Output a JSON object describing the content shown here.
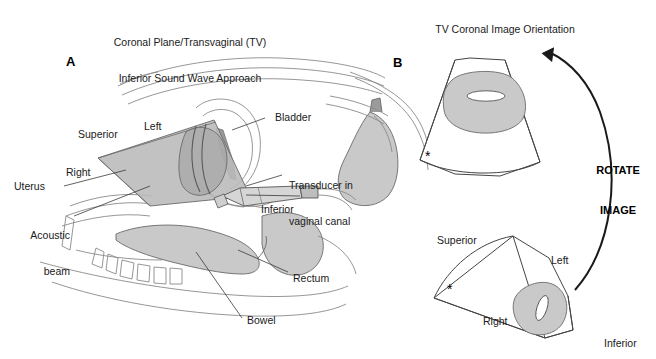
{
  "figure": {
    "panel_a": {
      "letter": "A",
      "title_line1": "Coronal Plane/Transvaginal (TV)",
      "title_line2": "Inferior Sound Wave Approach",
      "labels": {
        "superior": "Superior",
        "left": "Left",
        "right": "Right",
        "inferior": "Inferior",
        "uterus": "Uterus",
        "acoustic_beam_line1": "Acoustic",
        "acoustic_beam_line2": "beam",
        "bladder": "Bladder",
        "transducer_line1": "Transducer in",
        "transducer_line2": "vaginal canal",
        "rectum": "Rectum",
        "bowel": "Bowel"
      },
      "marker": "*"
    },
    "panel_b": {
      "letter": "B",
      "title": "TV Coronal Image Orientation",
      "rotate_line1": "ROTATE",
      "rotate_line2": "IMAGE",
      "upper_fan": {
        "marker": "*"
      },
      "lower_fan": {
        "marker": "*",
        "superior": "Superior",
        "left": "Left",
        "right": "Right",
        "inferior": "Inferior"
      }
    }
  },
  "colors": {
    "organ_fill": "#c9c9c9",
    "line": "#8a8a8a",
    "dark_line": "#222222",
    "text": "#1a1a1a",
    "white": "#ffffff"
  }
}
